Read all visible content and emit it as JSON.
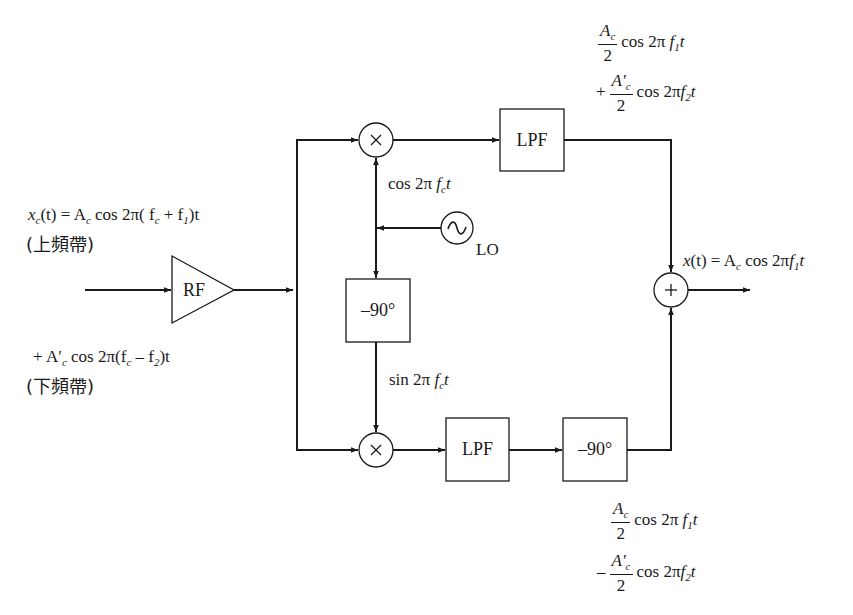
{
  "diagram": {
    "type": "SSB demodulator (phase-shift / quadrature receiver)",
    "colors": {
      "stroke": "#1a1a1a",
      "background": "#ffffff"
    },
    "blocks": {
      "rf_amp": "RF",
      "upper_mixer": "×",
      "lower_mixer": "×",
      "upper_lpf": "LPF",
      "lower_lpf": "LPF",
      "phase_shift_lo": "–90°",
      "phase_shift_lower": "–90°",
      "summer": "+",
      "oscillator": "~",
      "oscillator_label": "LO"
    },
    "input": {
      "line1_lhs": "x",
      "line1_lhs_sub": "c",
      "line1_rhs": "(t) = A",
      "line1_rhs_sub": "c",
      "line1_tail": " cos 2π( f",
      "line1_fc_sub": "c",
      "line1_plus": " + f",
      "line1_f1_sub": "1",
      "line1_end": ")t",
      "line1_full": "x_c(t) = A_c cos 2π(f_c + f_1)t",
      "upper_band": "(上頻帶)",
      "line2_full": "+ A′_c cos 2π(f_c − f_2)t",
      "line2_a": "+ A′",
      "line2_a_sub": "c",
      "line2_mid": " cos 2π(f",
      "line2_fc_sub": "c",
      "line2_minus": " – f",
      "line2_f2_sub": "2",
      "line2_end": ")t",
      "lower_band": "(下頻帶)"
    },
    "lo_signals": {
      "cos_full": "cos 2π f_c t",
      "cos_a": "cos 2π ",
      "cos_f": "f",
      "cos_sub": "c",
      "cos_t": "t",
      "sin_full": "sin 2π f_c t",
      "sin_a": "sin 2π ",
      "sin_f": "f",
      "sin_sub": "c",
      "sin_t": "t"
    },
    "upper_output": {
      "full": "A_c/2 cos 2π f_1 t + A′_c/2 cos 2π f_2 t",
      "t1_num": "A",
      "t1_num_sub": "c",
      "t1_den": "2",
      "t1_rest": "cos 2π ",
      "t1_f": "f",
      "t1_sub": "1",
      "t1_t": "t",
      "t2_sign": "+",
      "t2_num": "A′",
      "t2_num_sub": "c",
      "t2_den": "2",
      "t2_rest": "cos 2π",
      "t2_f": "f",
      "t2_sub": "2",
      "t2_t": "t"
    },
    "lower_output": {
      "full": "A_c/2 cos 2π f_1 t − A′_c/2 cos 2π f_2 t",
      "t1_num": "A",
      "t1_num_sub": "c",
      "t1_den": "2",
      "t1_rest": "cos 2π ",
      "t1_f": "f",
      "t1_sub": "1",
      "t1_t": "t",
      "t2_sign": "–",
      "t2_num": "A′",
      "t2_num_sub": "c",
      "t2_den": "2",
      "t2_rest": "cos 2π",
      "t2_f": "f",
      "t2_sub": "2",
      "t2_t": "t"
    },
    "final_output": {
      "full": "x(t) = A_c cos 2π f_1 t",
      "a": "x",
      "b": "(t) = A",
      "b_sub": "c",
      "c": " cos 2π",
      "f": "f",
      "f_sub": "1",
      "t": "t"
    }
  }
}
